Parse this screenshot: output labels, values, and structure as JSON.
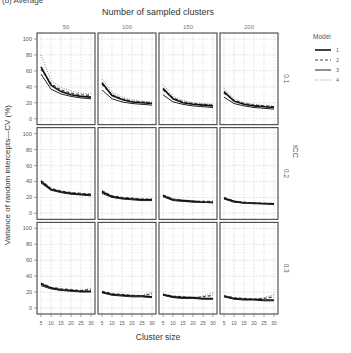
{
  "header": {
    "fragment": "(b) Average"
  },
  "chart_data": {
    "type": "line",
    "title": "Number of sampled clusters",
    "xlabel": "Cluster size",
    "ylabel": "Variance of random intercepts—CV (%)",
    "column_facet_values": [
      "50",
      "100",
      "150",
      "200"
    ],
    "row_facet_label": "ICC",
    "row_facet_values": [
      "0.1",
      "0.2",
      "0.3"
    ],
    "x": [
      5,
      10,
      15,
      20,
      25,
      30
    ],
    "x_ticks": [
      "5",
      "10",
      "15",
      "20",
      "25",
      "30"
    ],
    "y_ticks": [
      "0",
      "20",
      "40",
      "60",
      "80",
      "100"
    ],
    "ylim": [
      0,
      100
    ],
    "xlim": [
      5,
      30
    ],
    "grid": true,
    "legend": {
      "title": "Model",
      "position": "right",
      "entries": [
        "1",
        "2",
        "3",
        "4"
      ]
    },
    "panels": [
      {
        "icc": "0.1",
        "clusters": "50",
        "series": [
          {
            "name": "1",
            "values": [
              65,
              42,
              34,
              30,
              28,
              27
            ]
          },
          {
            "name": "2",
            "values": [
              62,
              44,
              36,
              32,
              30,
              29
            ]
          },
          {
            "name": "3",
            "values": [
              56,
              37,
              31,
              28,
              26,
              25
            ]
          },
          {
            "name": "4",
            "values": [
              80,
              48,
              39,
              35,
              32,
              31
            ]
          }
        ]
      },
      {
        "icc": "0.1",
        "clusters": "100",
        "series": [
          {
            "name": "1",
            "values": [
              45,
              29,
              24,
              21,
              20,
              19
            ]
          },
          {
            "name": "2",
            "values": [
              43,
              30,
              25,
              22,
              21,
              20
            ]
          },
          {
            "name": "3",
            "values": [
              36,
              25,
              21,
              19,
              18,
              17
            ]
          },
          {
            "name": "4",
            "values": [
              50,
              33,
              27,
              24,
              22,
              21
            ]
          }
        ]
      },
      {
        "icc": "0.1",
        "clusters": "150",
        "series": [
          {
            "name": "1",
            "values": [
              38,
              25,
              20,
              18,
              17,
              16
            ]
          },
          {
            "name": "2",
            "values": [
              36,
              26,
              21,
              19,
              18,
              17
            ]
          },
          {
            "name": "3",
            "values": [
              30,
              21,
              18,
              16,
              15,
              14
            ]
          },
          {
            "name": "4",
            "values": [
              43,
              28,
              23,
              20,
              19,
              18
            ]
          }
        ]
      },
      {
        "icc": "0.1",
        "clusters": "200",
        "series": [
          {
            "name": "1",
            "values": [
              34,
              22,
              18,
              16,
              15,
              14
            ]
          },
          {
            "name": "2",
            "values": [
              32,
              23,
              19,
              17,
              16,
              15
            ]
          },
          {
            "name": "3",
            "values": [
              27,
              19,
              16,
              14,
              13,
              12
            ]
          },
          {
            "name": "4",
            "values": [
              38,
              25,
              20,
              18,
              17,
              16
            ]
          }
        ]
      },
      {
        "icc": "0.2",
        "clusters": "50",
        "series": [
          {
            "name": "1",
            "values": [
              40,
              30,
              27,
              25,
              24,
              23
            ]
          },
          {
            "name": "2",
            "values": [
              41,
              31,
              28,
              26,
              25,
              24
            ]
          },
          {
            "name": "3",
            "values": [
              38,
              29,
              26,
              24,
              23,
              22
            ]
          },
          {
            "name": "4",
            "values": [
              42,
              32,
              28,
              26,
              25,
              24
            ]
          }
        ]
      },
      {
        "icc": "0.2",
        "clusters": "100",
        "series": [
          {
            "name": "1",
            "values": [
              27,
              21,
              19,
              18,
              17,
              17
            ]
          },
          {
            "name": "2",
            "values": [
              28,
              22,
              20,
              19,
              18,
              18
            ]
          },
          {
            "name": "3",
            "values": [
              25,
              20,
              18,
              17,
              16,
              16
            ]
          },
          {
            "name": "4",
            "values": [
              29,
              22,
              20,
              19,
              18,
              18
            ]
          }
        ]
      },
      {
        "icc": "0.2",
        "clusters": "150",
        "series": [
          {
            "name": "1",
            "values": [
              22,
              17,
              16,
              15,
              14,
              14
            ]
          },
          {
            "name": "2",
            "values": [
              23,
              18,
              16,
              15,
              15,
              15
            ]
          },
          {
            "name": "3",
            "values": [
              21,
              16,
              15,
              14,
              14,
              13
            ]
          },
          {
            "name": "4",
            "values": [
              23,
              18,
              17,
              16,
              15,
              15
            ]
          }
        ]
      },
      {
        "icc": "0.2",
        "clusters": "200",
        "series": [
          {
            "name": "1",
            "values": [
              19,
              15,
              13,
              13,
              12,
              12
            ]
          },
          {
            "name": "2",
            "values": [
              20,
              15,
              14,
              13,
              13,
              12
            ]
          },
          {
            "name": "3",
            "values": [
              18,
              14,
              13,
              12,
              12,
              11
            ]
          },
          {
            "name": "4",
            "values": [
              20,
              16,
              14,
              13,
              13,
              13
            ]
          }
        ]
      },
      {
        "icc": "0.3",
        "clusters": "50",
        "series": [
          {
            "name": "1",
            "values": [
              30,
              25,
              23,
              22,
              21,
              21
            ]
          },
          {
            "name": "2",
            "values": [
              31,
              26,
              24,
              23,
              22,
              23
            ]
          },
          {
            "name": "3",
            "values": [
              28,
              24,
              22,
              21,
              20,
              20
            ]
          },
          {
            "name": "4",
            "values": [
              32,
              26,
              24,
              23,
              22,
              25
            ]
          }
        ]
      },
      {
        "icc": "0.3",
        "clusters": "100",
        "series": [
          {
            "name": "1",
            "values": [
              20,
              17,
              16,
              15,
              15,
              14
            ]
          },
          {
            "name": "2",
            "values": [
              21,
              18,
              17,
              16,
              15,
              18
            ]
          },
          {
            "name": "3",
            "values": [
              19,
              16,
              15,
              14,
              14,
              13
            ]
          },
          {
            "name": "4",
            "values": [
              21,
              18,
              17,
              16,
              16,
              20
            ]
          }
        ]
      },
      {
        "icc": "0.3",
        "clusters": "150",
        "series": [
          {
            "name": "1",
            "values": [
              17,
              14,
              13,
              13,
              12,
              12
            ]
          },
          {
            "name": "2",
            "values": [
              17,
              15,
              14,
              13,
              14,
              16
            ]
          },
          {
            "name": "3",
            "values": [
              16,
              13,
              12,
              12,
              11,
              11
            ]
          },
          {
            "name": "4",
            "values": [
              18,
              15,
              14,
              13,
              15,
              19
            ]
          }
        ]
      },
      {
        "icc": "0.3",
        "clusters": "200",
        "series": [
          {
            "name": "1",
            "values": [
              15,
              12,
              11,
              11,
              10,
              10
            ]
          },
          {
            "name": "2",
            "values": [
              15,
              13,
              12,
              11,
              12,
              14
            ]
          },
          {
            "name": "3",
            "values": [
              14,
              11,
              10,
              10,
              9,
              9
            ]
          },
          {
            "name": "4",
            "values": [
              16,
              13,
              12,
              11,
              13,
              17
            ]
          }
        ]
      }
    ]
  },
  "styles": {
    "line_color": "#1a1a1a",
    "grid_color": "#bdbdbd",
    "frame_color": "#333333",
    "text_color": "#555555",
    "model_styles": {
      "1": {
        "dash": "",
        "width": 1.6,
        "color": "#111111"
      },
      "2": {
        "dash": "3,2",
        "width": 1.2,
        "color": "#444444"
      },
      "3": {
        "dash": "",
        "width": 1.0,
        "color": "#222222"
      },
      "4": {
        "dash": "1,1.5",
        "width": 1.0,
        "color": "#888888"
      }
    }
  }
}
